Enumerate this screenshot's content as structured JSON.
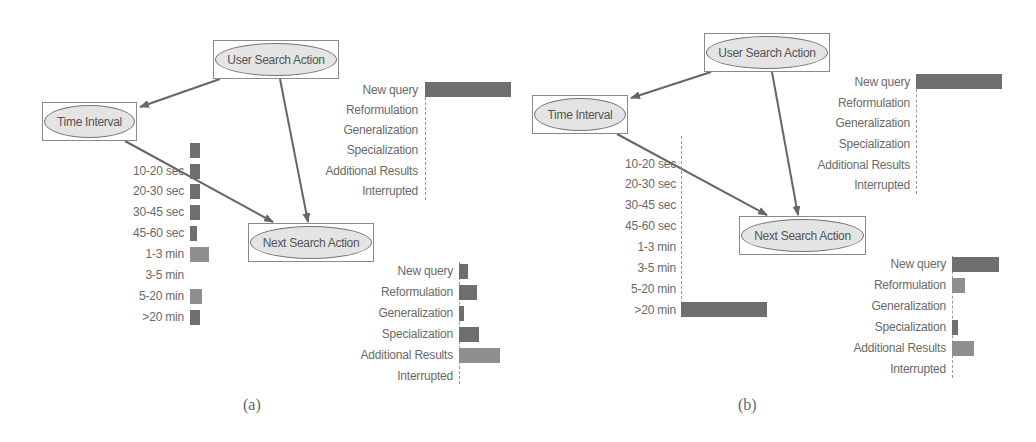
{
  "figure": {
    "captions": [
      "(a)",
      "(b)"
    ]
  },
  "panels": [
    {
      "id": "a",
      "nodes": {
        "user_search_action": "User Search Action",
        "time_interval": "Time Interval",
        "next_search_action": "Next Search Action"
      },
      "user_search_action_bars": [
        {
          "label": "New query",
          "value": 1.0
        },
        {
          "label": "Reformulation",
          "value": 0.0
        },
        {
          "label": "Generalization",
          "value": 0.0
        },
        {
          "label": "Specialization",
          "value": 0.0
        },
        {
          "label": "Additional Results",
          "value": 0.0
        },
        {
          "label": "Interrupted",
          "value": 0.0
        }
      ],
      "time_interval_bars": [
        {
          "label": "",
          "value": 0.11
        },
        {
          "label": "10-20 sec",
          "value": 0.11
        },
        {
          "label": "20-30 sec",
          "value": 0.11
        },
        {
          "label": "30-45 sec",
          "value": 0.11
        },
        {
          "label": "45-60 sec",
          "value": 0.08
        },
        {
          "label": "1-3 min",
          "value": 0.22
        },
        {
          "label": "3-5 min",
          "value": 0.0
        },
        {
          "label": "5-20 min",
          "value": 0.13
        },
        {
          "label": ">20 min",
          "value": 0.11
        }
      ],
      "next_search_action_bars": [
        {
          "label": "New query",
          "value": 0.2
        },
        {
          "label": "Reformulation",
          "value": 0.38
        },
        {
          "label": "Generalization",
          "value": 0.1
        },
        {
          "label": "Specialization",
          "value": 0.42
        },
        {
          "label": "Additional Results",
          "value": 0.86
        },
        {
          "label": "Interrupted",
          "value": 0.0
        }
      ]
    },
    {
      "id": "b",
      "nodes": {
        "user_search_action": "User Search Action",
        "time_interval": "Time Interval",
        "next_search_action": "Next Search Action"
      },
      "user_search_action_bars": [
        {
          "label": "New query",
          "value": 1.0
        },
        {
          "label": "Reformulation",
          "value": 0.0
        },
        {
          "label": "Generalization",
          "value": 0.0
        },
        {
          "label": "Specialization",
          "value": 0.0
        },
        {
          "label": "Additional Results",
          "value": 0.0
        },
        {
          "label": "Interrupted",
          "value": 0.0
        }
      ],
      "time_interval_bars": [
        {
          "label": "",
          "value": 0.0
        },
        {
          "label": "10-20 sec",
          "value": 0.0
        },
        {
          "label": "20-30 sec",
          "value": 0.0
        },
        {
          "label": "30-45 sec",
          "value": 0.0
        },
        {
          "label": "45-60 sec",
          "value": 0.0
        },
        {
          "label": "1-3 min",
          "value": 0.0
        },
        {
          "label": "3-5 min",
          "value": 0.0
        },
        {
          "label": "5-20 min",
          "value": 0.0
        },
        {
          "label": ">20 min",
          "value": 1.0
        }
      ],
      "next_search_action_bars": [
        {
          "label": "New query",
          "value": 0.54
        },
        {
          "label": "Reformulation",
          "value": 0.15
        },
        {
          "label": "Generalization",
          "value": 0.0
        },
        {
          "label": "Specialization",
          "value": 0.06
        },
        {
          "label": "Additional Results",
          "value": 0.25
        },
        {
          "label": "Interrupted",
          "value": 0.0
        }
      ]
    }
  ],
  "colors": {
    "bar": "#6f6f6f",
    "node_fill": "#e4e4e4",
    "edge": "#666666"
  }
}
